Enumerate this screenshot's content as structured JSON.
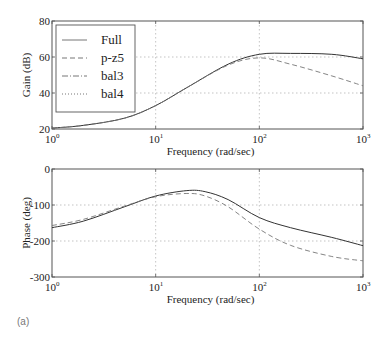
{
  "panel_label": "(a)",
  "chart_data": [
    {
      "type": "line",
      "title": "",
      "xlabel": "Frequency (rad/sec)",
      "ylabel": "Gain (dB)",
      "xscale": "log",
      "xlim": [
        1,
        1000
      ],
      "ylim": [
        20,
        80
      ],
      "xticks": [
        1,
        10,
        100,
        1000
      ],
      "xtick_labels": [
        "10^0",
        "10^1",
        "10^2",
        "10^3"
      ],
      "yticks": [
        20,
        40,
        60,
        80
      ],
      "ytick_labels": [
        "20",
        "40",
        "60",
        "80"
      ],
      "grid": true,
      "legend": {
        "position": "upper left",
        "entries": [
          {
            "label": "Full",
            "style": "solid"
          },
          {
            "label": "p-z5",
            "style": "dashed"
          },
          {
            "label": "bal3",
            "style": "dashdot"
          },
          {
            "label": "bal4",
            "style": "dotted"
          }
        ]
      },
      "x": [
        1,
        2,
        5,
        10,
        20,
        50,
        100,
        200,
        500,
        1000
      ],
      "series": [
        {
          "name": "Full",
          "style": "solid",
          "values": [
            20.5,
            22,
            26,
            33,
            43,
            56,
            61.5,
            62,
            61.5,
            59
          ]
        },
        {
          "name": "p-z5",
          "style": "dashed",
          "values": [
            20.5,
            22,
            26,
            33,
            43,
            55.5,
            59.5,
            56,
            49.5,
            44
          ]
        }
      ]
    },
    {
      "type": "line",
      "title": "",
      "xlabel": "Frequency (rad/sec)",
      "ylabel": "Phase (deg)",
      "xscale": "log",
      "xlim": [
        1,
        1000
      ],
      "ylim": [
        -300,
        0
      ],
      "xticks": [
        1,
        10,
        100,
        1000
      ],
      "xtick_labels": [
        "10^0",
        "10^1",
        "10^2",
        "10^3"
      ],
      "yticks": [
        -300,
        -200,
        -100,
        0
      ],
      "ytick_labels": [
        "-300",
        "-200",
        "-100",
        "0"
      ],
      "grid": true,
      "x": [
        1,
        2,
        5,
        10,
        20,
        30,
        50,
        100,
        200,
        500,
        1000
      ],
      "series": [
        {
          "name": "Full",
          "style": "solid",
          "values": [
            -163,
            -145,
            -105,
            -75,
            -60,
            -63,
            -85,
            -135,
            -163,
            -190,
            -213
          ]
        },
        {
          "name": "p-z5",
          "style": "dashed",
          "values": [
            -157,
            -140,
            -103,
            -77,
            -68,
            -75,
            -105,
            -167,
            -212,
            -243,
            -255
          ]
        }
      ]
    }
  ]
}
